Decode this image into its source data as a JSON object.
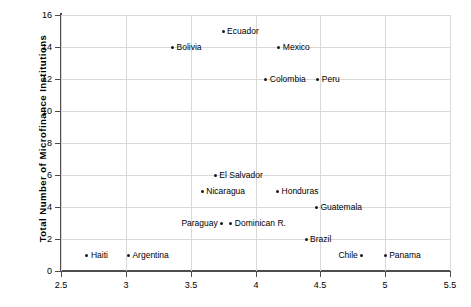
{
  "chart_data": {
    "type": "scatter",
    "title": "",
    "xlabel": "",
    "ylabel": "Total Number of Microfinance Institutions",
    "xlim": [
      2.5,
      5.5
    ],
    "ylim": [
      0,
      16
    ],
    "xticks": [
      "2.5",
      "3",
      "3.5",
      "4",
      "4.5",
      "5",
      "5.5"
    ],
    "xtick_values": [
      2.5,
      3,
      3.5,
      4,
      4.5,
      5,
      5.5
    ],
    "yticks": [
      "0",
      "2",
      "4",
      "6",
      "8",
      "10",
      "12",
      "14",
      "16"
    ],
    "ytick_values": [
      0,
      2,
      4,
      6,
      8,
      10,
      12,
      14,
      16
    ],
    "grid": true,
    "legend": "none",
    "points": [
      {
        "label": "Ecuador",
        "x": 3.75,
        "y": 15,
        "label_side": "right"
      },
      {
        "label": "Bolivia",
        "x": 3.36,
        "y": 14,
        "label_side": "right"
      },
      {
        "label": "Mexico",
        "x": 4.18,
        "y": 14,
        "label_side": "right"
      },
      {
        "label": "Colombia",
        "x": 4.08,
        "y": 12,
        "label_side": "right"
      },
      {
        "label": "Peru",
        "x": 4.48,
        "y": 12,
        "label_side": "right"
      },
      {
        "label": "El Salvador",
        "x": 3.69,
        "y": 6,
        "label_side": "right"
      },
      {
        "label": "Nicaragua",
        "x": 3.59,
        "y": 5,
        "label_side": "right"
      },
      {
        "label": "Honduras",
        "x": 4.17,
        "y": 5,
        "label_side": "right"
      },
      {
        "label": "Guatemala",
        "x": 4.47,
        "y": 4,
        "label_side": "right"
      },
      {
        "label": "Paraguay",
        "x": 3.74,
        "y": 3,
        "label_side": "left"
      },
      {
        "label": "Dominican R.",
        "x": 3.81,
        "y": 3,
        "label_side": "right"
      },
      {
        "label": "Brazil",
        "x": 4.39,
        "y": 2,
        "label_side": "right"
      },
      {
        "label": "Haiti",
        "x": 2.7,
        "y": 1,
        "label_side": "right"
      },
      {
        "label": "Argentina",
        "x": 3.02,
        "y": 1,
        "label_side": "right"
      },
      {
        "label": "Chile",
        "x": 4.82,
        "y": 1,
        "label_side": "left"
      },
      {
        "label": "Panama",
        "x": 5.0,
        "y": 1,
        "label_side": "right"
      }
    ],
    "colors": {
      "marker": "#1a1a1a",
      "grid": "#d9d9d9",
      "axis": "#4d4d4d",
      "background": "#ffffff"
    }
  }
}
